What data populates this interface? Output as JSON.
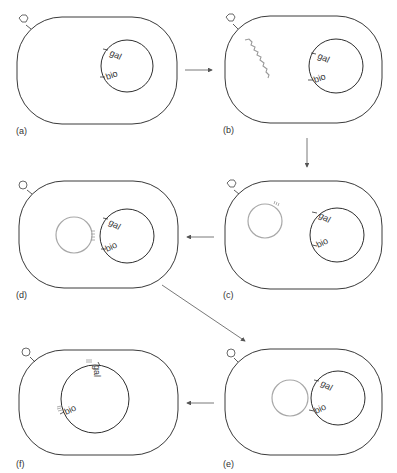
{
  "figure": {
    "colors": {
      "cell_outline": "#3a3a3a",
      "chromosome": "#2e2e2e",
      "phage_dna": "#a8a8a8",
      "arrows": "#555555"
    },
    "panels": [
      {
        "id": "a",
        "label": "(a)",
        "gene1": "gal",
        "gene2": "bio"
      },
      {
        "id": "b",
        "label": "(b)",
        "gene1": "gal",
        "gene2": "bio"
      },
      {
        "id": "c",
        "label": "(c)",
        "gene1": "gal",
        "gene2": "bio"
      },
      {
        "id": "d",
        "label": "(d)",
        "gene1": "gal",
        "gene2": "bio"
      },
      {
        "id": "e",
        "label": "(e)",
        "gene1": "gal",
        "gene2": "bio"
      },
      {
        "id": "f",
        "label": "(f)",
        "gene1": "gal",
        "gene2": "bio"
      }
    ],
    "icons": {
      "phage": "phage-icon",
      "arrow": "arrow-icon"
    }
  }
}
